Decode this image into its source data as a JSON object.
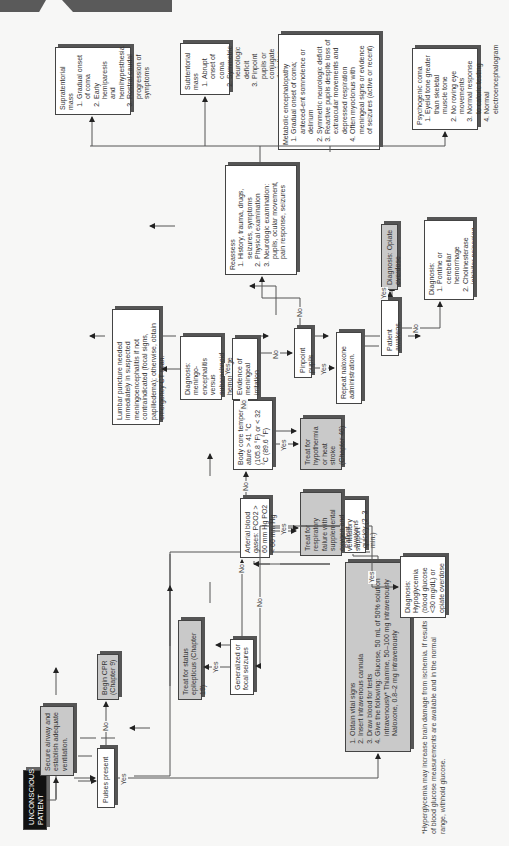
{
  "header": {
    "page_tab": "",
    "section_tab": ""
  },
  "flowchart": {
    "start": "UNCONSCIOUS PATIENT",
    "secure_airway": "Secure airway and establish adequate ventilation.",
    "pulses_present": "Pulses present",
    "begin_cpr": "Begin CPR (Chapter 9)",
    "initial_steps": {
      "items": [
        "Obtain vital signs",
        "Insert intravenous cannula",
        "Draw blood for tests",
        "Give the following: Glucose, 50 mL of 50% solution intravenously* Thiamine, 50–100 mg intravenously Naloxone, 0.8–2 mg intravenously"
      ]
    },
    "patient_awakens_quickly": "Patient awakens quickly (2–3 min.)",
    "diagnosis_hypoglycemia": "Diagnosis: Hypoglycemia (blood glucose <30 mg/dL) or opiate overdose",
    "seizures": "Generalized or focal seizures",
    "status_epilepticus": "Treat for status epilepticus (Chapter 19)",
    "abg": "Arterial blood gases: PCO2 > 60 mm Hg PO2 < 60 mm Hg",
    "resp_failure": "Treat for respiratory failure with supplemental oxygen and ventilatory support",
    "core_temp": "Body core temper-ature > 41 °C (105.8 °F) or < 32 °C (89.6 °F)",
    "hypothermia": "Treat for hypothermia or heat stroke (Chapter 46)",
    "meningeal": "Evidence of meningeal irritation",
    "dx_meningo": "Diagnosis: meningo-encephalitis versus subarachnoid hemorrhage",
    "lumbar": "Lumbar puncture needed immediately in suspected meningoencephalitis if not contraindicated (focal signs, papilledema); otherwise, obtain emergency CT scan.",
    "pinpoint": "Pinpoint pupils",
    "repeat_naloxone": "Repeat naloxone administration.",
    "patient_awakens": "Patient awakens.",
    "dx_opiate": "Diagnosis: Opiate overdose",
    "dx_pontine": {
      "title": "Diagnosis:",
      "items": [
        "Pontine or cerebellar hemorrhage",
        "Cholinesterase inhibitor poisoning",
        "Miotic eye drops and coma of"
      ]
    },
    "reassess": {
      "title": "Reassess",
      "items": [
        "History, trauma, drugs, seizures, symptoms",
        "Physical examination",
        "Neurologic examination: pupils, ocular movement, pain response, seizures"
      ]
    },
    "supratentorial": {
      "title": "Supratentorial mass",
      "items": [
        "Gradual onset of coma",
        "Early hemiparesis and hemihypesthesia",
        "Rostral caudal progression of symptoms"
      ]
    },
    "subtentorial": {
      "title": "Subtentorial mass",
      "items": [
        "Abrupt onset of coma",
        "Symmetric neurologic deficit",
        "Pinpoint pupils or conjugate deviation of gaze"
      ]
    },
    "metabolic": {
      "title": "Metabolic encephalopathy",
      "items": [
        "Gradual onset of coma; anteced-ent somnolence or delirium",
        "Symmetric neurologic deficit",
        "Reactive pupils despite loss of extraocular movements and depressed respiration",
        "Often myoclonus with meningeal signs or evidence of seizures (active or recent)"
      ]
    },
    "psychogenic": {
      "title": "Psychogenic coma",
      "items": [
        "Eyelid tone greater than skeletal muscle tone",
        "No roving eye movements",
        "Normal response to caloric testing",
        "Normal electroencephalogram"
      ]
    },
    "labels": {
      "yes": "Yes",
      "no": "No"
    }
  },
  "footnote": "*Hyperglycemia may increase brain damage from ischemia. If results of blood glucose measurements are available and in the normal range, withhold glucose."
}
